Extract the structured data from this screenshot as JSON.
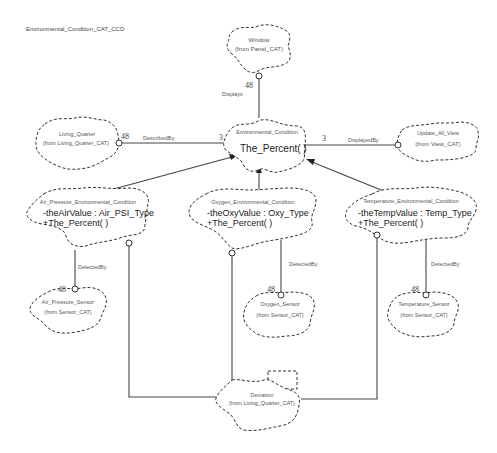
{
  "diagram": {
    "title": "Environmental_Condition_CAT_CCD",
    "type": "UML class diagram (Booch cloud notation)",
    "classes": [
      {
        "id": "window",
        "name": "Window",
        "from": "(from Panel_CAT)"
      },
      {
        "id": "living_quarter",
        "name": "Living_Quarter",
        "from": "(from Living_Quarter_CAT)"
      },
      {
        "id": "environmental_condition",
        "name": "Environmental_Condition",
        "operations": [
          "The_Percent( )"
        ]
      },
      {
        "id": "update_all_view",
        "name": "Update_All_View",
        "from": "(from View_CAT)"
      },
      {
        "id": "air_pressure_env",
        "name": "Air_Pressure_Environmental_Condition",
        "attributes": [
          "-theAirValue : Air_PSI_Type"
        ],
        "operations": [
          "+The_Percent( )"
        ]
      },
      {
        "id": "oxygen_env",
        "name": "Oxygen_Environmental_Condition",
        "attributes": [
          "-theOxyValue : Oxy_Type"
        ],
        "operations": [
          "+The_Percent( )"
        ]
      },
      {
        "id": "temperature_env",
        "name": "Temperature_Environmental_Condition",
        "attributes": [
          "-theTempValue : Temp_Type"
        ],
        "operations": [
          "+The_Percent( )"
        ]
      },
      {
        "id": "air_pressure_sensor",
        "name": "Air_Pressure_Sensor",
        "from": "(from Sensor_CAT)"
      },
      {
        "id": "oxygen_sensor",
        "name": "Oxygen_Sensor",
        "from": "(from Sensor_CAT)"
      },
      {
        "id": "temperature_sensor",
        "name": "Temperature_Sensor",
        "from": "(from Sensor_CAT)"
      },
      {
        "id": "deviation",
        "name": "Deviation",
        "from": "(from Living_Quarter_CAT)"
      }
    ],
    "relations": {
      "displays": {
        "label": "Displays",
        "mult": "48"
      },
      "described_by": {
        "label": "DescribedBy",
        "mult_left": "48",
        "mult_right": "3"
      },
      "displayed_by": {
        "label": "DisplayedBy",
        "mult": "3"
      },
      "air_detected_by": {
        "label": "DetectedBy",
        "mult": "48"
      },
      "oxy_detected_by": {
        "label": "DetectedBy",
        "mult": "48"
      },
      "temp_detected_by": {
        "label": "DetectedBy",
        "mult": "48"
      }
    }
  }
}
